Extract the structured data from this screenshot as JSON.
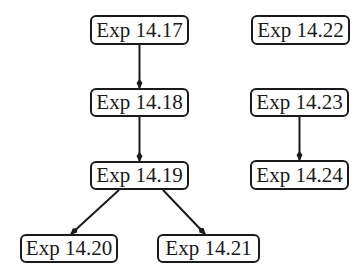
{
  "nodes": [
    {
      "id": "n1417",
      "label": "Exp 14.17"
    },
    {
      "id": "n1418",
      "label": "Exp 14.18"
    },
    {
      "id": "n1419",
      "label": "Exp 14.19"
    },
    {
      "id": "n1420",
      "label": "Exp 14.20"
    },
    {
      "id": "n1421",
      "label": "Exp 14.21"
    },
    {
      "id": "n1422",
      "label": "Exp 14.22"
    },
    {
      "id": "n1423",
      "label": "Exp 14.23"
    },
    {
      "id": "n1424",
      "label": "Exp 14.24"
    }
  ],
  "edges": [
    {
      "from": "Exp 14.17",
      "to": "Exp 14.18"
    },
    {
      "from": "Exp 14.18",
      "to": "Exp 14.19"
    },
    {
      "from": "Exp 14.19",
      "to": "Exp 14.20"
    },
    {
      "from": "Exp 14.19",
      "to": "Exp 14.21"
    },
    {
      "from": "Exp 14.23",
      "to": "Exp 14.24"
    }
  ],
  "colors": {
    "stroke": "#1a1a1a",
    "background": "#ffffff"
  }
}
